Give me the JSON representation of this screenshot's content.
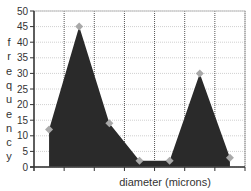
{
  "chart_data": {
    "type": "area",
    "title": "",
    "xlabel": "diameter  (microns)",
    "ylabel": "frequency",
    "ylim": [
      0,
      50
    ],
    "yticks": [
      0,
      5,
      10,
      15,
      20,
      25,
      30,
      35,
      40,
      45,
      50
    ],
    "grid": true,
    "legend": null,
    "x": [
      1,
      2,
      3,
      4,
      5,
      6,
      7
    ],
    "categories": [
      "",
      "",
      "",
      "",
      "",
      "",
      ""
    ],
    "values": [
      12,
      45,
      14,
      2,
      2,
      30,
      3
    ],
    "colors": {
      "fill": "#2a2a2a",
      "marker": "#a9a9a9",
      "grid": "#d0d0d0",
      "vgrid": "#555555",
      "axis": "#333333"
    }
  }
}
